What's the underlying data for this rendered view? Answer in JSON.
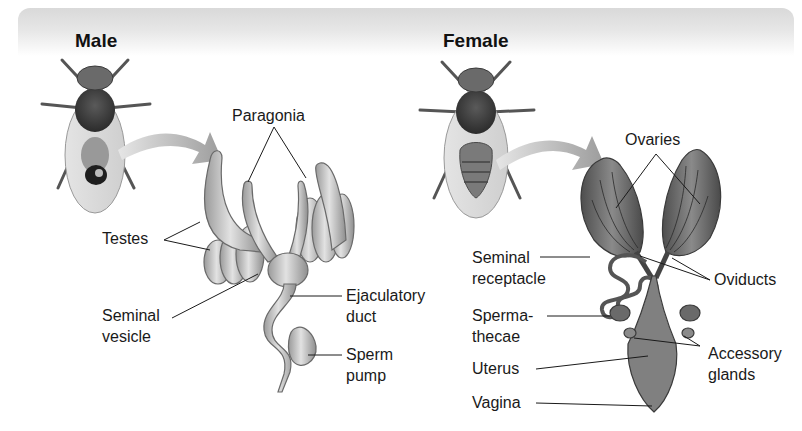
{
  "figure": {
    "colors": {
      "header_band": "#dcdcdc",
      "organ_fill": "#c8c8c8",
      "organ_dark": "#6e6e6e",
      "arrow": "#a9a9a9",
      "text": "#1a1a1a"
    }
  },
  "male": {
    "title": "Male",
    "labels": {
      "paragonia": "Paragonia",
      "testes": "Testes",
      "seminal_vesicle_1": "Seminal",
      "seminal_vesicle_2": "vesicle",
      "ejaculatory_duct_1": "Ejaculatory",
      "ejaculatory_duct_2": "duct",
      "sperm_pump_1": "Sperm",
      "sperm_pump_2": "pump"
    }
  },
  "female": {
    "title": "Female",
    "labels": {
      "ovaries": "Ovaries",
      "seminal_receptacle_1": "Seminal",
      "seminal_receptacle_2": "receptacle",
      "oviducts": "Oviducts",
      "spermathecae_1": "Sperma-",
      "spermathecae_2": "thecae",
      "uterus": "Uterus",
      "accessory_glands_1": "Accessory",
      "accessory_glands_2": "glands",
      "vagina": "Vagina"
    }
  }
}
